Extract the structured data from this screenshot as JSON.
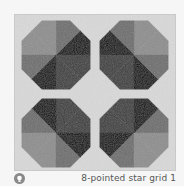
{
  "figure": {
    "caption": "8-pointed star grid 1",
    "hint_icon": "lightbulb-icon",
    "background": {
      "x": 14,
      "y": 14,
      "w": 162,
      "h": 157,
      "color": "#d9d9d9",
      "border": "#bdbdbd"
    },
    "colors": {
      "L": "#8e8e8e",
      "M": "#6e6e6e",
      "D": "#3e3e3e",
      "K": "#111111"
    },
    "octagon_radius": 37,
    "octagons": [
      {
        "name": "top-left",
        "cx": 56,
        "cy": 55,
        "wedges": [
          "K",
          "M",
          "L",
          "L",
          "M",
          "K",
          "D",
          "D"
        ]
      },
      {
        "name": "top-right",
        "cx": 134,
        "cy": 55,
        "wedges": [
          "L",
          "L",
          "M",
          "K",
          "D",
          "D",
          "K",
          "M"
        ]
      },
      {
        "name": "bottom-left",
        "cx": 56,
        "cy": 133,
        "wedges": [
          "D",
          "D",
          "K",
          "M",
          "L",
          "L",
          "M",
          "K"
        ]
      },
      {
        "name": "bottom-right",
        "cx": 134,
        "cy": 133,
        "wedges": [
          "M",
          "K",
          "D",
          "D",
          "K",
          "M",
          "L",
          "L"
        ]
      }
    ]
  }
}
